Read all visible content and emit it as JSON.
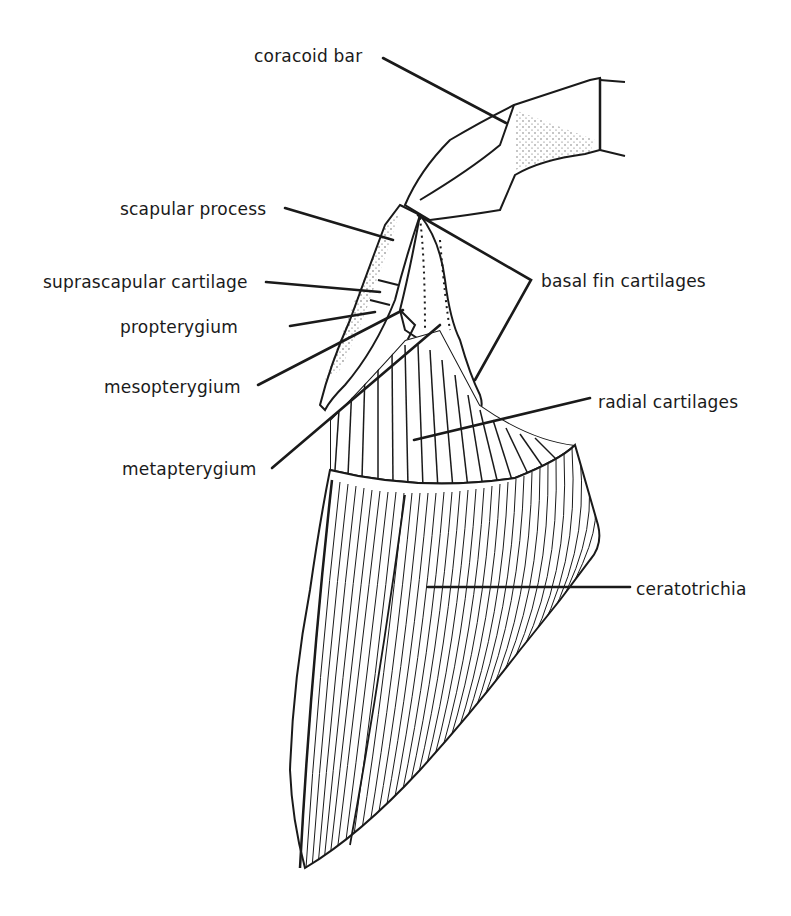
{
  "figure": {
    "ink_color": "#1a1a1a",
    "background": "#ffffff"
  },
  "labels": {
    "coracoid_bar": "coracoid bar",
    "scapular_process": "scapular process",
    "suprascapular_cartilage": "suprascapular cartilage",
    "propterygium": "propterygium",
    "mesopterygium": "mesopterygium",
    "metapterygium": "metapterygium",
    "basal_fin_cartilages": "basal fin cartilages",
    "radial_cartilages": "radial cartilages",
    "ceratotrichia": "ceratotrichia"
  }
}
